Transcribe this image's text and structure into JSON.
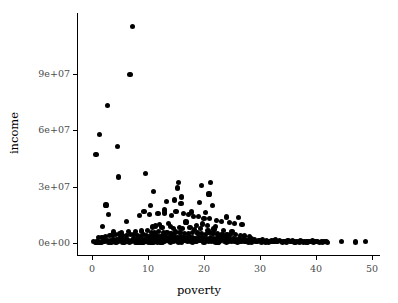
{
  "chart_data": {
    "type": "scatter",
    "title": "",
    "xlabel": "poverty",
    "ylabel": "income",
    "xlim": [
      -1.5,
      52
    ],
    "ylim": [
      -4000000,
      122000000
    ],
    "grid": false,
    "legend": null,
    "x_ticks": [
      {
        "value": 0,
        "label": "0"
      },
      {
        "value": 10,
        "label": "10"
      },
      {
        "value": 20,
        "label": "20"
      },
      {
        "value": 30,
        "label": "30"
      },
      {
        "value": 40,
        "label": "40"
      },
      {
        "value": 50,
        "label": "50"
      }
    ],
    "y_ticks": [
      {
        "value": 0,
        "label": "0e+00"
      },
      {
        "value": 30000000,
        "label": "3e+07"
      },
      {
        "value": 60000000,
        "label": "6e+07"
      },
      {
        "value": 90000000,
        "label": "9e+07"
      }
    ],
    "point_color": "#000000",
    "point_size": 5.2,
    "n_points": 322,
    "x": [
      7.3,
      6.8,
      2.8,
      1.4,
      4.6,
      0.7,
      4.7,
      9.6,
      15.5,
      21.2,
      19.6,
      15.3,
      11.0,
      20.9,
      16.0,
      2.5,
      14.8,
      13.3,
      3.0,
      10.5,
      15.9,
      19.2,
      21.5,
      9.3,
      12.9,
      17.8,
      20.3,
      24.0,
      26.2,
      1.9,
      6.1,
      8.5,
      10.2,
      11.8,
      13.0,
      14.2,
      15.0,
      16.4,
      17.2,
      18.1,
      19.0,
      20.0,
      21.0,
      22.3,
      23.1,
      24.5,
      25.4,
      12.1,
      13.7,
      16.8,
      18.6,
      19.8,
      20.6,
      22.0,
      10.8,
      11.4,
      12.5,
      14.0,
      14.5,
      15.6,
      16.2,
      17.5,
      18.3,
      19.4,
      20.7,
      21.8,
      23.5,
      25.0,
      26.8,
      3.8,
      5.2,
      6.5,
      7.8,
      8.9,
      9.9,
      10.6,
      11.2,
      11.9,
      12.7,
      13.4,
      14.1,
      14.9,
      15.7,
      16.5,
      17.3,
      18.0,
      18.8,
      19.5,
      20.2,
      20.9,
      21.6,
      22.4,
      23.2,
      24.1,
      24.8,
      25.6,
      26.5,
      27.3,
      28.1,
      1.1,
      1.8,
      2.4,
      3.1,
      3.6,
      4.2,
      4.9,
      5.5,
      6.2,
      6.9,
      7.5,
      8.1,
      8.7,
      9.2,
      9.8,
      10.3,
      10.9,
      11.5,
      12.0,
      12.6,
      13.1,
      13.6,
      14.3,
      14.7,
      15.2,
      15.8,
      16.3,
      16.9,
      17.4,
      17.9,
      18.4,
      19.1,
      19.7,
      20.4,
      21.1,
      21.7,
      22.2,
      22.8,
      23.4,
      23.9,
      24.6,
      25.2,
      25.8,
      26.3,
      27.0,
      27.6,
      28.4,
      29.0,
      29.7,
      30.5,
      31.2,
      32.0,
      32.8,
      33.5,
      34.3,
      35.0,
      35.8,
      36.5,
      37.2,
      38.0,
      38.7,
      39.4,
      40.2,
      41.0,
      41.8,
      44.6,
      47.0,
      48.9,
      0.3,
      0.6,
      0.9,
      1.3,
      1.6,
      2.0,
      2.3,
      2.7,
      3.3,
      3.9,
      4.4,
      5.0,
      5.6,
      6.0,
      6.4,
      7.0,
      7.4,
      7.9,
      8.3,
      8.8,
      9.4,
      10.0,
      10.4,
      11.1,
      11.6,
      12.2,
      12.8,
      13.2,
      13.8,
      14.4,
      15.1,
      15.4,
      16.1,
      16.6,
      17.0,
      17.7,
      18.2,
      18.9,
      19.3,
      20.1,
      20.5,
      21.3,
      21.9,
      22.6,
      23.0,
      23.7,
      24.3,
      24.9,
      25.5,
      26.0,
      26.6,
      27.2,
      27.8,
      28.6,
      29.3,
      30.0,
      30.8,
      31.6,
      32.4,
      33.1,
      33.9,
      34.6,
      35.4,
      36.1,
      36.9,
      37.6,
      38.3,
      39.0,
      39.8,
      40.6,
      41.4,
      4.0,
      5.8,
      7.1,
      8.2,
      9.0,
      9.5,
      10.1,
      10.7,
      11.3,
      11.7,
      12.3,
      12.9,
      13.5,
      14.6,
      15.3,
      16.7,
      17.6,
      18.5,
      19.9,
      21.4,
      22.7,
      24.2,
      25.9,
      27.5,
      29.5,
      31.0,
      33.0,
      35.5,
      37.8,
      40.0,
      2.1,
      3.4,
      4.7,
      6.3,
      7.7,
      8.6,
      9.7,
      11.0,
      12.4,
      13.9,
      15.5,
      17.1,
      18.7,
      20.8,
      22.5,
      24.4,
      26.1,
      28.0,
      30.2,
      32.5,
      34.8,
      36.3,
      38.5,
      41.2,
      1.5,
      2.9,
      4.3,
      5.4,
      6.7,
      8.0,
      9.1,
      10.5,
      12.5,
      14.0,
      16.0,
      18.0,
      20.0,
      22.0,
      24.0,
      26.0,
      28.5,
      31.5,
      34.0,
      37.0,
      39.5,
      42.0
    ],
    "y": [
      115000000,
      89500000,
      72800000,
      57800000,
      51200000,
      46800000,
      35000000,
      37000000,
      32200000,
      32200000,
      30400000,
      29200000,
      27300000,
      26000000,
      24400000,
      20200000,
      22800000,
      21900000,
      15000000,
      19900000,
      21000000,
      21400000,
      20000000,
      16900000,
      17500000,
      16500000,
      16200000,
      13800000,
      13500000,
      8600000,
      11500000,
      14800000,
      15300000,
      15600000,
      15900000,
      14600000,
      16800000,
      15500000,
      15100000,
      14200000,
      13900000,
      13200000,
      12800000,
      11900000,
      11400000,
      10800000,
      10200000,
      9800000,
      10500000,
      11200000,
      9500000,
      10100000,
      9200000,
      8800000,
      8500000,
      9000000,
      8200000,
      8900000,
      7800000,
      8400000,
      7500000,
      8100000,
      7200000,
      7900000,
      6800000,
      7400000,
      6500000,
      6200000,
      9800000,
      5800000,
      5500000,
      6100000,
      5900000,
      6400000,
      6700000,
      5600000,
      5300000,
      6000000,
      5700000,
      5400000,
      5100000,
      5800000,
      5500000,
      5200000,
      4900000,
      5600000,
      5300000,
      5000000,
      4700000,
      5400000,
      5100000,
      4800000,
      4500000,
      4200000,
      4600000,
      4300000,
      4000000,
      3700000,
      3400000,
      2800000,
      3100000,
      3500000,
      3900000,
      4200000,
      4500000,
      4800000,
      4100000,
      3800000,
      4400000,
      4700000,
      4000000,
      3600000,
      4300000,
      3900000,
      3500000,
      4100000,
      3700000,
      3300000,
      3800000,
      3400000,
      3000000,
      3600000,
      3200000,
      2900000,
      3500000,
      3100000,
      2700000,
      3300000,
      2900000,
      2500000,
      3100000,
      2700000,
      2300000,
      2900000,
      2500000,
      2100000,
      2700000,
      2300000,
      1900000,
      2500000,
      2100000,
      1700000,
      2300000,
      1900000,
      1500000,
      2100000,
      1700000,
      1300000,
      1900000,
      1500000,
      1100000,
      1700000,
      1300000,
      900000,
      1500000,
      1100000,
      800000,
      1300000,
      950000,
      700000,
      1100000,
      850000,
      600000,
      900000,
      700000,
      500000,
      800000,
      650000,
      450000,
      500000,
      400000,
      350000,
      900000,
      1100000,
      1300000,
      1500000,
      1700000,
      1900000,
      2100000,
      1800000,
      1600000,
      2000000,
      1400000,
      2200000,
      1800000,
      1500000,
      2400000,
      2000000,
      1700000,
      2300000,
      1900000,
      1600000,
      2200000,
      1800000,
      1500000,
      2100000,
      1700000,
      1400000,
      2000000,
      1600000,
      1300000,
      1900000,
      1500000,
      1200000,
      1800000,
      1400000,
      1100000,
      1700000,
      1300000,
      1000000,
      1600000,
      1200000,
      900000,
      1500000,
      1100000,
      800000,
      1400000,
      1000000,
      750000,
      1300000,
      950000,
      700000,
      1200000,
      900000,
      650000,
      1100000,
      850000,
      600000,
      1000000,
      800000,
      550000,
      900000,
      700000,
      500000,
      850000,
      650000,
      480000,
      800000,
      600000,
      450000,
      750000,
      550000,
      420000,
      700000,
      500000,
      400000,
      650000,
      480000,
      380000,
      1000000,
      1200000,
      900000,
      1100000,
      1300000,
      800000,
      1000000,
      1200000,
      700000,
      900000,
      1100000,
      600000,
      800000,
      1000000,
      500000,
      700000,
      900000,
      450000,
      650000,
      850000,
      400000,
      600000,
      800000,
      350000,
      550000,
      750000,
      300000,
      500000,
      700000,
      280000,
      600000,
      700000,
      800000,
      500000,
      600000,
      700000,
      400000,
      500000,
      600000,
      350000,
      450000,
      550000,
      300000,
      400000,
      500000,
      280000,
      380000,
      480000,
      250000,
      350000,
      450000,
      220000,
      320000,
      400000,
      300000,
      400000,
      500000,
      250000,
      350000,
      450000,
      200000,
      300000,
      400000,
      180000,
      280000,
      380000,
      160000,
      260000,
      360000,
      150000,
      250000,
      350000,
      140000,
      240000
    ]
  }
}
